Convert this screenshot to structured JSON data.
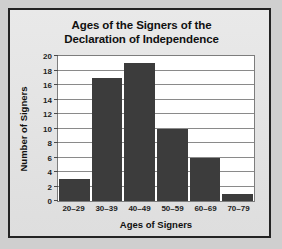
{
  "chart_data": {
    "type": "bar",
    "title": "Ages of the Signers of the Declaration of Independence",
    "title_lines": [
      "Ages of the Signers of the",
      "Declaration of Independence"
    ],
    "xlabel": "Ages of Signers",
    "ylabel": "Number of Signers",
    "categories": [
      "20–29",
      "30–39",
      "40–49",
      "50–59",
      "60–69",
      "70–79"
    ],
    "values": [
      3,
      17,
      19,
      10,
      6,
      1
    ],
    "ylim": [
      0,
      20
    ],
    "ytick_values": [
      0,
      2,
      4,
      6,
      8,
      10,
      12,
      14,
      16,
      18,
      20
    ],
    "ytick_labels": [
      "0",
      "2",
      "4",
      "6",
      "8",
      "10",
      "12",
      "14",
      "16",
      "18",
      "20"
    ],
    "grid": "horizontal",
    "legend": "none",
    "bar_color": "#3c3c3c",
    "plot_background": "#ffffff",
    "figure_background": "#dedede",
    "frame_color": "#232323",
    "grid_color": "#8a8a8a",
    "text_color": "#101010"
  }
}
